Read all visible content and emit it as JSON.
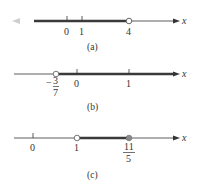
{
  "figure": {
    "panels": [
      {
        "caption": "(a)",
        "axis_label": "x",
        "ticks": [
          "0",
          "1",
          "4"
        ],
        "interval": "(-∞, 4)",
        "endpoints": [
          {
            "value": "4",
            "type": "open"
          }
        ],
        "shaded_direction": "left-to-infinity"
      },
      {
        "caption": "(b)",
        "axis_label": "x",
        "ticks": [
          "-3/7",
          "0",
          "1"
        ],
        "tick_fraction": {
          "sign": "−",
          "numerator": "3",
          "denominator": "7"
        },
        "interval": "(-3/7, ∞)",
        "endpoints": [
          {
            "value": "-3/7",
            "type": "open"
          }
        ],
        "shaded_direction": "right-to-infinity"
      },
      {
        "caption": "(c)",
        "axis_label": "x",
        "ticks": [
          "0",
          "1",
          "11/5"
        ],
        "tick_fraction": {
          "numerator": "11",
          "denominator": "5"
        },
        "interval": "(1, 11/5]",
        "endpoints": [
          {
            "value": "1",
            "type": "open"
          },
          {
            "value": "11/5",
            "type": "closed"
          }
        ],
        "shaded_direction": "bounded"
      }
    ],
    "colors": {
      "axis": "#333333",
      "shade": "#444444",
      "arrow_fade": "#c8c8c8",
      "closed_point": "#8a8a8a"
    }
  }
}
